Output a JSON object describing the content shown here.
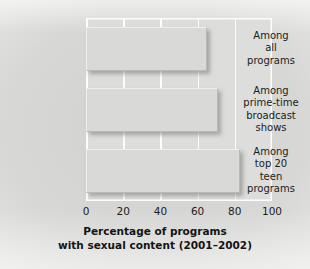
{
  "chart_data": {
    "type": "bar",
    "orientation": "horizontal",
    "title": "",
    "xlabel": "Percentage of programs\nwith sexual content (2001–2002)",
    "xlabel_line1": "Percentage of programs",
    "xlabel_line2": "with sexual content (2001–2002)",
    "ylabel": "",
    "categories": [
      "Among\nall\nprograms",
      "Among\nprime-time\nbroadcast\nshows",
      "Among\ntop 20\nteen\nprograms"
    ],
    "values": [
      65,
      71,
      83
    ],
    "xlim": [
      0,
      100
    ],
    "xticks": [
      "0",
      "20",
      "40",
      "60",
      "80",
      "100"
    ],
    "xtick_values": [
      0,
      20,
      40,
      60,
      80,
      100
    ],
    "grid": true,
    "grid_axis": "x",
    "legend": "none",
    "colors": {
      "bar_fill": "#d9d9d7",
      "plot_background": "#dddddb",
      "gridline": "#fdfdfd",
      "text": "#1c1c1c",
      "page_background": "#cdcdcb"
    }
  }
}
